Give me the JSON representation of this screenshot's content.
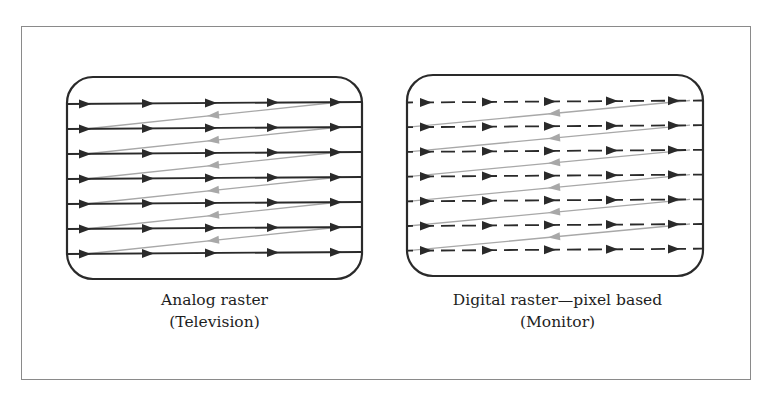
{
  "figure": {
    "panels": [
      {
        "id": "analog",
        "caption_line1": "Analog raster",
        "caption_line2": "(Television)",
        "scan_line_style": "solid",
        "scan_lines": 7,
        "retrace_lines": 6
      },
      {
        "id": "digital",
        "caption_line1": "Digital raster—pixel based",
        "caption_line2": "(Monitor)",
        "scan_line_style": "dashed",
        "scan_lines": 7,
        "retrace_lines": 6
      }
    ],
    "colors": {
      "scan_line": "#2a2a2a",
      "retrace_line": "#a8a8a8",
      "screen_border": "#2a2a2a",
      "frame_border": "#8a8a8a"
    },
    "icons": {
      "scan_arrow": "arrowhead-right-icon",
      "retrace_arrow": "arrowhead-left-icon"
    }
  }
}
